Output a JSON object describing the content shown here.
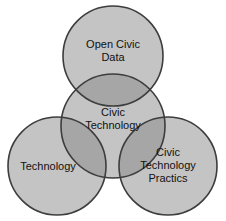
{
  "diagram": {
    "type": "venn",
    "title": "",
    "background_color": "#ffffff",
    "fill_color": "#c4c4c4",
    "overlap_color": "#a8a8a8",
    "stroke_color": "#3d3d3d",
    "text_color": "#111111",
    "circles": [
      {
        "id": "open-civic-data",
        "label": "Open Civic Data",
        "position": "top",
        "cx": 113,
        "cy": 56,
        "r": 50
      },
      {
        "id": "civic-technology",
        "label": "Civic Technology",
        "position": "center",
        "cx": 113,
        "cy": 126,
        "r": 52
      },
      {
        "id": "technology",
        "label": "Technology",
        "position": "bottom-left",
        "cx": 57,
        "cy": 166,
        "r": 49
      },
      {
        "id": "civic-technology-practices",
        "label": "Civic Technology Practices",
        "position": "bottom-right",
        "cx": 168,
        "cy": 166,
        "r": 49
      }
    ]
  },
  "labels": {
    "open_civic_data": "Open Civic\nData",
    "civic_technology": "Civic\nTechnology",
    "technology": "Technology",
    "civic_technology_practices": "Civic\nTechnology\nPractics"
  }
}
